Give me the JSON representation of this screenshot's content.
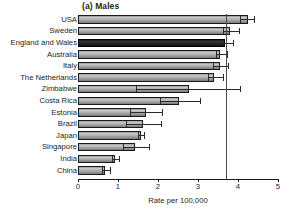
{
  "chart_data": {
    "type": "bar",
    "orientation": "horizontal",
    "title": "(a) Males",
    "xlabel": "Rate per 100,000",
    "ylabel": "",
    "xlim": [
      0,
      5
    ],
    "xticks": [
      0,
      1,
      2,
      3,
      4,
      5
    ],
    "xtick_labels": [
      "0",
      "1",
      "2",
      "3",
      "4",
      "5"
    ],
    "grid": false,
    "legend": "none",
    "reference_line": 3.7,
    "highlight_category": "England and Wales",
    "categories": [
      "USA",
      "Sweden",
      "England and Wales",
      "Australia",
      "Italy",
      "The Netherlands",
      "Zimbabwe",
      "Costa Rica",
      "Estonia",
      "Brazil",
      "Japan",
      "Singapore",
      "India",
      "China"
    ],
    "values": [
      4.25,
      3.8,
      3.68,
      3.55,
      3.55,
      3.4,
      2.78,
      2.52,
      1.7,
      1.63,
      1.58,
      1.43,
      0.93,
      0.68
    ],
    "error_low": [
      4.05,
      3.63,
      3.58,
      3.45,
      3.38,
      3.25,
      1.45,
      2.05,
      1.3,
      1.2,
      1.5,
      1.13,
      0.85,
      0.6
    ],
    "error_high": [
      4.4,
      4.02,
      3.88,
      3.72,
      3.75,
      3.62,
      4.05,
      3.05,
      2.1,
      2.08,
      1.65,
      1.78,
      1.03,
      0.8
    ]
  }
}
